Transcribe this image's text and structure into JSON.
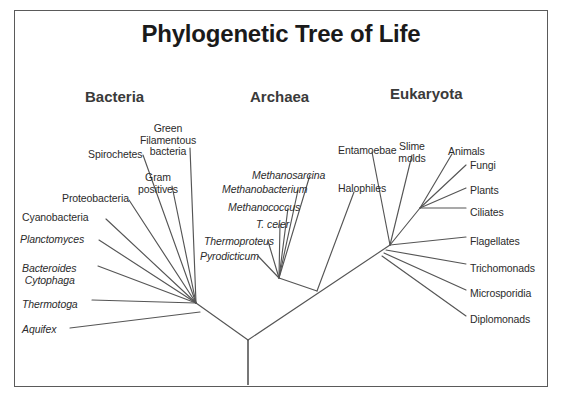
{
  "figure": {
    "title": "Phylogenetic Tree of Life",
    "line_color": "#555555",
    "text_color": "#2b2b2b",
    "border_color": "#5a5a5a",
    "background": "#ffffff"
  },
  "domains": [
    {
      "name": "bacteria-header",
      "label": "Bacteria",
      "x": 85,
      "y": 88
    },
    {
      "name": "archaea-header",
      "label": "Archaea",
      "x": 250,
      "y": 88
    },
    {
      "name": "eukaryota-header",
      "label": "Eukaryota",
      "x": 390,
      "y": 85
    }
  ],
  "labels": {
    "bacteria": [
      {
        "text": "Spirochetes",
        "italic": false,
        "x": 88,
        "y": 149,
        "align": "left"
      },
      {
        "text": "Green\nFilamentous\nbacteria",
        "italic": false,
        "x": 168,
        "y": 123,
        "align": "center"
      },
      {
        "text": "Gram\npositives",
        "italic": false,
        "x": 158,
        "y": 172,
        "align": "center"
      },
      {
        "text": "Proteobacteria",
        "italic": false,
        "x": 62,
        "y": 193,
        "align": "left"
      },
      {
        "text": "Cyanobacteria",
        "italic": false,
        "x": 22,
        "y": 212,
        "align": "left"
      },
      {
        "text": "Planctomyces",
        "italic": true,
        "x": 20,
        "y": 234,
        "align": "left"
      },
      {
        "text": "Bacteroides\n Cytophaga",
        "italic": true,
        "x": 22,
        "y": 263,
        "align": "left"
      },
      {
        "text": "Thermotoga",
        "italic": true,
        "x": 22,
        "y": 299,
        "align": "left"
      },
      {
        "text": "Aquifex",
        "italic": true,
        "x": 22,
        "y": 324,
        "align": "left"
      }
    ],
    "archaea": [
      {
        "text": "Methanosarcina",
        "italic": true,
        "x": 252,
        "y": 170,
        "align": "left"
      },
      {
        "text": "Methanobacterium",
        "italic": true,
        "x": 222,
        "y": 184,
        "align": "left"
      },
      {
        "text": "Methanococcus",
        "italic": true,
        "x": 228,
        "y": 202,
        "align": "left"
      },
      {
        "text": "T. celer",
        "italic": true,
        "x": 256,
        "y": 219,
        "align": "left"
      },
      {
        "text": "Thermoproteus",
        "italic": true,
        "x": 204,
        "y": 236,
        "align": "left"
      },
      {
        "text": "Pyrodicticum",
        "italic": true,
        "x": 200,
        "y": 251,
        "align": "left"
      },
      {
        "text": "Halophiles",
        "italic": false,
        "x": 338,
        "y": 183,
        "align": "left"
      }
    ],
    "eukaryota": [
      {
        "text": "Entamoebae",
        "italic": false,
        "x": 338,
        "y": 145,
        "align": "left"
      },
      {
        "text": "Slime\nmolds",
        "italic": false,
        "x": 412,
        "y": 141,
        "align": "center"
      },
      {
        "text": "Animals",
        "italic": false,
        "x": 448,
        "y": 146,
        "align": "left"
      },
      {
        "text": "Fungi",
        "italic": false,
        "x": 470,
        "y": 160,
        "align": "left"
      },
      {
        "text": "Plants",
        "italic": false,
        "x": 470,
        "y": 185,
        "align": "left"
      },
      {
        "text": "Ciliates",
        "italic": false,
        "x": 470,
        "y": 207,
        "align": "left"
      },
      {
        "text": "Flagellates",
        "italic": false,
        "x": 470,
        "y": 236,
        "align": "left"
      },
      {
        "text": "Trichomonads",
        "italic": false,
        "x": 470,
        "y": 263,
        "align": "left"
      },
      {
        "text": "Microsporidia",
        "italic": false,
        "x": 470,
        "y": 288,
        "align": "left"
      },
      {
        "text": "Diplomonads",
        "italic": false,
        "x": 470,
        "y": 314,
        "align": "left"
      }
    ]
  },
  "tree": {
    "root": {
      "x": 248,
      "y": 340
    },
    "stem": {
      "x1": 248,
      "y1": 340,
      "x2": 248,
      "y2": 385
    },
    "nodes": {
      "bacteria_node": {
        "x": 196,
        "y": 303
      },
      "archaea_eukaryota_node": {
        "x": 285,
        "y": 300
      },
      "archaea_node": {
        "x": 279,
        "y": 278
      },
      "eukaryota_base": {
        "x": 390,
        "y": 245
      },
      "eukaryota_crown": {
        "x": 420,
        "y": 208
      }
    },
    "branches": [
      {
        "name": "root-to-bacteria",
        "x1": 248,
        "y1": 340,
        "x2": 196,
        "y2": 303
      },
      {
        "name": "root-to-archaea-euk",
        "x1": 248,
        "y1": 340,
        "x2": 390,
        "y2": 245
      },
      {
        "name": "archaea-stem",
        "x1": 317,
        "y1": 291,
        "x2": 279,
        "y2": 278
      },
      {
        "name": "spirochetes",
        "x1": 196,
        "y1": 303,
        "x2": 143,
        "y2": 155
      },
      {
        "name": "green-filamentous",
        "x1": 196,
        "y1": 303,
        "x2": 190,
        "y2": 148
      },
      {
        "name": "gram-positives",
        "x1": 196,
        "y1": 303,
        "x2": 172,
        "y2": 186
      },
      {
        "name": "proteobacteria",
        "x1": 196,
        "y1": 303,
        "x2": 129,
        "y2": 200
      },
      {
        "name": "cyanobacteria",
        "x1": 196,
        "y1": 303,
        "x2": 106,
        "y2": 219
      },
      {
        "name": "planctomyces",
        "x1": 196,
        "y1": 303,
        "x2": 99,
        "y2": 240
      },
      {
        "name": "bacteroides",
        "x1": 196,
        "y1": 303,
        "x2": 98,
        "y2": 266
      },
      {
        "name": "thermotoga",
        "x1": 196,
        "y1": 303,
        "x2": 92,
        "y2": 300
      },
      {
        "name": "aquifex",
        "x1": 200,
        "y1": 312,
        "x2": 70,
        "y2": 328
      },
      {
        "name": "methanosarcina",
        "x1": 279,
        "y1": 278,
        "x2": 310,
        "y2": 175
      },
      {
        "name": "methanobacterium",
        "x1": 279,
        "y1": 278,
        "x2": 298,
        "y2": 190
      },
      {
        "name": "methanococcus",
        "x1": 279,
        "y1": 278,
        "x2": 288,
        "y2": 208
      },
      {
        "name": "t-celer",
        "x1": 279,
        "y1": 278,
        "x2": 280,
        "y2": 224
      },
      {
        "name": "thermoproteus",
        "x1": 279,
        "y1": 278,
        "x2": 268,
        "y2": 241
      },
      {
        "name": "pyrodicticum",
        "x1": 279,
        "y1": 278,
        "x2": 258,
        "y2": 256
      },
      {
        "name": "halophiles",
        "x1": 317,
        "y1": 291,
        "x2": 354,
        "y2": 192
      },
      {
        "name": "entamoebae",
        "x1": 390,
        "y1": 245,
        "x2": 372,
        "y2": 152
      },
      {
        "name": "slime-molds",
        "x1": 390,
        "y1": 245,
        "x2": 412,
        "y2": 155
      },
      {
        "name": "animals",
        "x1": 420,
        "y1": 208,
        "x2": 452,
        "y2": 154
      },
      {
        "name": "fungi",
        "x1": 420,
        "y1": 208,
        "x2": 466,
        "y2": 165
      },
      {
        "name": "plants",
        "x1": 420,
        "y1": 208,
        "x2": 466,
        "y2": 188
      },
      {
        "name": "ciliates",
        "x1": 420,
        "y1": 208,
        "x2": 466,
        "y2": 208
      },
      {
        "name": "euk-crown-stem",
        "x1": 390,
        "y1": 245,
        "x2": 420,
        "y2": 208
      },
      {
        "name": "flagellates",
        "x1": 390,
        "y1": 245,
        "x2": 466,
        "y2": 237
      },
      {
        "name": "trichomonads",
        "x1": 386,
        "y1": 250,
        "x2": 466,
        "y2": 264
      },
      {
        "name": "microsporidia",
        "x1": 384,
        "y1": 253,
        "x2": 466,
        "y2": 290
      },
      {
        "name": "diplomonads",
        "x1": 382,
        "y1": 256,
        "x2": 466,
        "y2": 316
      }
    ]
  }
}
